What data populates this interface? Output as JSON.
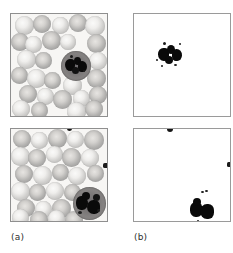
{
  "figure": {
    "type": "microscopy-figure-grid",
    "rows": 2,
    "columns": 2,
    "captions": [
      {
        "id": "a",
        "label": "(a)"
      },
      {
        "id": "b",
        "label": "(b)"
      }
    ],
    "colors": {
      "background": "#ffffff",
      "panel_border": "#8f8f8f",
      "smear_background": "#f7f6f4",
      "erythrocyte_ring": "#b8b8b8",
      "leukocyte_cytoplasm": "#7b7878",
      "nucleus": "#121212"
    },
    "panels": [
      {
        "name": "original-top",
        "column": "a",
        "row": 1,
        "kind": "original-stained-blood-smear",
        "content": "peripheral blood smear with erythrocytes and one segmented-nucleus leukocyte near center"
      },
      {
        "name": "mask-top",
        "column": "b",
        "row": 1,
        "kind": "binary-segmentation-mask",
        "content": "extracted leukocyte nucleus lobes only, white background"
      },
      {
        "name": "original-bottom",
        "column": "a",
        "row": 2,
        "kind": "original-stained-blood-smear",
        "content": "peripheral blood smear with erythrocytes and one leukocyte in lower-right region"
      },
      {
        "name": "mask-bottom",
        "column": "b",
        "row": 2,
        "kind": "binary-segmentation-mask",
        "content": "extracted leukocyte nucleus in lower-right plus two border artifacts"
      }
    ],
    "erythrocytes": {
      "top_panel": [
        {
          "x": 4,
          "y": 2,
          "d": 19,
          "tone": "lt"
        },
        {
          "x": 22,
          "y": 1,
          "d": 18,
          "tone": "dk"
        },
        {
          "x": 41,
          "y": 3,
          "d": 17,
          "tone": "lt"
        },
        {
          "x": 58,
          "y": 0,
          "d": 18,
          "tone": "dk"
        },
        {
          "x": 74,
          "y": 2,
          "d": 20,
          "tone": "lt"
        },
        {
          "x": 0,
          "y": 19,
          "d": 18,
          "tone": "dk"
        },
        {
          "x": 14,
          "y": 22,
          "d": 17,
          "tone": "lt"
        },
        {
          "x": 31,
          "y": 17,
          "d": 19,
          "tone": "dk"
        },
        {
          "x": 49,
          "y": 20,
          "d": 16,
          "tone": "lt"
        },
        {
          "x": 76,
          "y": 20,
          "d": 19,
          "tone": "dk"
        },
        {
          "x": 6,
          "y": 36,
          "d": 19,
          "tone": "lt"
        },
        {
          "x": 24,
          "y": 38,
          "d": 17,
          "tone": "dk"
        },
        {
          "x": 78,
          "y": 38,
          "d": 18,
          "tone": "lt"
        },
        {
          "x": 0,
          "y": 53,
          "d": 17,
          "tone": "dk"
        },
        {
          "x": 16,
          "y": 55,
          "d": 19,
          "tone": "lt"
        },
        {
          "x": 33,
          "y": 58,
          "d": 17,
          "tone": "dk"
        },
        {
          "x": 76,
          "y": 55,
          "d": 19,
          "tone": "dk"
        },
        {
          "x": 52,
          "y": 62,
          "d": 19,
          "tone": "lt"
        },
        {
          "x": 8,
          "y": 71,
          "d": 18,
          "tone": "dk"
        },
        {
          "x": 26,
          "y": 74,
          "d": 17,
          "tone": "lt"
        },
        {
          "x": 42,
          "y": 76,
          "d": 19,
          "tone": "dk"
        },
        {
          "x": 62,
          "y": 76,
          "d": 17,
          "tone": "lt"
        },
        {
          "x": 78,
          "y": 72,
          "d": 18,
          "tone": "dk"
        },
        {
          "x": 1,
          "y": 86,
          "d": 18,
          "tone": "lt"
        },
        {
          "x": 20,
          "y": 88,
          "d": 17,
          "tone": "dk"
        },
        {
          "x": 56,
          "y": 88,
          "d": 19,
          "tone": "lt"
        },
        {
          "x": 74,
          "y": 86,
          "d": 18,
          "tone": "dk"
        }
      ],
      "bottom_panel": [
        {
          "x": 2,
          "y": 1,
          "d": 18,
          "tone": "dk"
        },
        {
          "x": 20,
          "y": 3,
          "d": 17,
          "tone": "lt"
        },
        {
          "x": 37,
          "y": 0,
          "d": 19,
          "tone": "dk"
        },
        {
          "x": 56,
          "y": 2,
          "d": 17,
          "tone": "lt"
        },
        {
          "x": 73,
          "y": 1,
          "d": 20,
          "tone": "dk"
        },
        {
          "x": 0,
          "y": 18,
          "d": 19,
          "tone": "lt"
        },
        {
          "x": 17,
          "y": 20,
          "d": 18,
          "tone": "dk"
        },
        {
          "x": 35,
          "y": 17,
          "d": 17,
          "tone": "lt"
        },
        {
          "x": 51,
          "y": 19,
          "d": 19,
          "tone": "dk"
        },
        {
          "x": 70,
          "y": 20,
          "d": 18,
          "tone": "lt"
        },
        {
          "x": 4,
          "y": 36,
          "d": 18,
          "tone": "dk"
        },
        {
          "x": 22,
          "y": 37,
          "d": 19,
          "tone": "lt"
        },
        {
          "x": 41,
          "y": 35,
          "d": 17,
          "tone": "dk"
        },
        {
          "x": 57,
          "y": 38,
          "d": 18,
          "tone": "lt"
        },
        {
          "x": 76,
          "y": 36,
          "d": 17,
          "tone": "dk"
        },
        {
          "x": 0,
          "y": 53,
          "d": 19,
          "tone": "lt"
        },
        {
          "x": 18,
          "y": 55,
          "d": 17,
          "tone": "dk"
        },
        {
          "x": 35,
          "y": 53,
          "d": 18,
          "tone": "lt"
        },
        {
          "x": 53,
          "y": 55,
          "d": 17,
          "tone": "dk"
        },
        {
          "x": 6,
          "y": 70,
          "d": 18,
          "tone": "dk"
        },
        {
          "x": 24,
          "y": 72,
          "d": 17,
          "tone": "lt"
        },
        {
          "x": 41,
          "y": 70,
          "d": 19,
          "tone": "dk"
        },
        {
          "x": 1,
          "y": 86,
          "d": 17,
          "tone": "lt"
        },
        {
          "x": 19,
          "y": 88,
          "d": 18,
          "tone": "dk"
        },
        {
          "x": 37,
          "y": 87,
          "d": 17,
          "tone": "lt"
        },
        {
          "x": 54,
          "y": 88,
          "d": 18,
          "tone": "dk"
        }
      ]
    },
    "leukocytes": [
      {
        "panel": "top",
        "cx": 50,
        "cy": 37,
        "d": 30
      },
      {
        "panel": "bottom",
        "cx": 65,
        "cy": 70,
        "d": 32
      }
    ]
  }
}
